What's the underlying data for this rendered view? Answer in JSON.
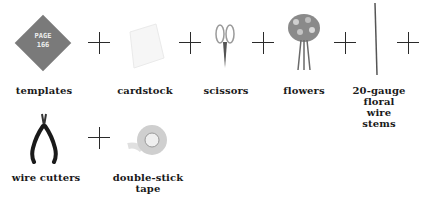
{
  "badge": {
    "line1": "PAGE",
    "line2": "166"
  },
  "supplies": [
    {
      "label": "templates"
    },
    {
      "label": "cardstock"
    },
    {
      "label": "scissors"
    },
    {
      "label": "flowers"
    },
    {
      "label": "20-gauge floral wire stems"
    },
    {
      "label": "wire cutters"
    },
    {
      "label": "double-stick tape"
    }
  ]
}
